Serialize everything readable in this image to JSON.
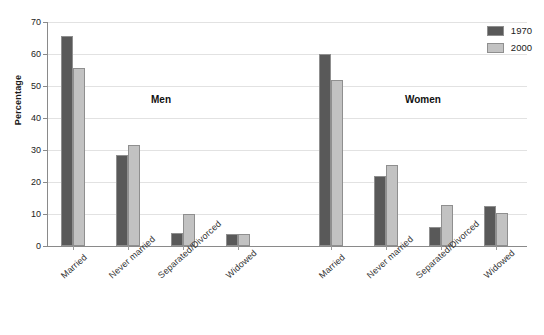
{
  "chart_data": {
    "type": "bar",
    "title": "",
    "xlabel": "",
    "ylabel": "Percentage",
    "ylim": [
      0,
      70
    ],
    "yticks": [
      0,
      10,
      20,
      30,
      40,
      50,
      60,
      70
    ],
    "grid": true,
    "legend_position": "top-right",
    "groups": [
      "Men",
      "Women"
    ],
    "categories": [
      "Married",
      "Never married",
      "Separated/Divorced",
      "Widowed"
    ],
    "series": [
      {
        "name": "1970",
        "color": "#595959",
        "values_by_group": {
          "Men": [
            65.5,
            28.5,
            4.0,
            3.6
          ],
          "Women": [
            60.0,
            21.8,
            6.0,
            12.6
          ]
        }
      },
      {
        "name": "2000",
        "color": "#c2c2c2",
        "values_by_group": {
          "Men": [
            55.5,
            31.5,
            10.0,
            3.9
          ],
          "Women": [
            52.0,
            25.4,
            12.8,
            10.3
          ]
        }
      }
    ]
  },
  "axis": {
    "y_title": "Percentage",
    "tick_0": "0",
    "tick_10": "10",
    "tick_20": "20",
    "tick_30": "30",
    "tick_40": "40",
    "tick_50": "50",
    "tick_60": "60",
    "tick_70": "70"
  },
  "group_labels": {
    "men": "Men",
    "women": "Women"
  },
  "x_labels": {
    "men": [
      "Married",
      "Never married",
      "Separated/Divorced",
      "Widowed"
    ],
    "women": [
      "Married",
      "Never married",
      "Separated/Divorced",
      "Widowed"
    ]
  },
  "legend": {
    "items": [
      {
        "label": "1970",
        "color": "#595959"
      },
      {
        "label": "2000",
        "color": "#c2c2c2"
      }
    ]
  },
  "colors": {
    "series_1970": "#595959",
    "series_2000": "#c2c2c2",
    "gridline": "#e2e2e2",
    "axis": "#8a8a8a",
    "background": "#ffffff"
  }
}
